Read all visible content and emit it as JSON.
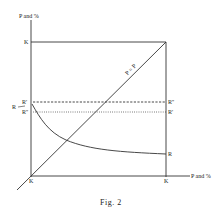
{
  "figure": {
    "caption": "Fig. 2",
    "y_axis_label": "P and %",
    "x_axis_label": "P and %",
    "diagonal_label": "P = P",
    "labels": {
      "top_left_K": "K",
      "bottom_left_K": "K",
      "bottom_right_K": "K",
      "left_R_prime": "R'",
      "left_R": "R",
      "left_R_double_prime": "R''",
      "right_R_double_prime": "R''",
      "right_R_prime": "R'",
      "right_R": "R"
    }
  },
  "colors": {
    "line": "#333333",
    "background": "#ffffff"
  }
}
